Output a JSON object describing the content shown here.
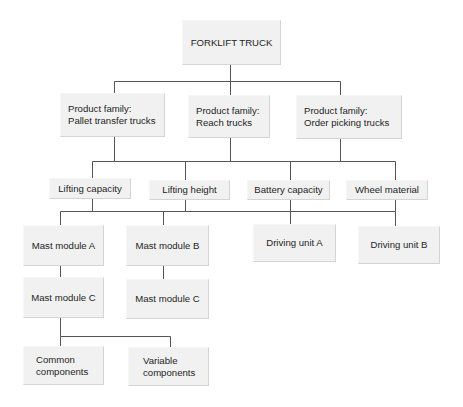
{
  "diagram": {
    "type": "hierarchy",
    "root": "FORKLIFT TRUCK",
    "product_families": [
      "Product family:\nPallet transfer trucks",
      "Product family:\nReach trucks",
      "Product family:\nOrder picking trucks"
    ],
    "attributes": [
      "Lifting capacity",
      "Lifting height",
      "Battery capacity",
      "Wheel material"
    ],
    "modules": [
      "Mast module A",
      "Mast module B",
      "Driving unit A",
      "Driving unit B"
    ],
    "submodules": [
      "Mast module C",
      "Mast module C"
    ],
    "components": [
      "Common\ncomponents",
      "Variable\ncomponents"
    ]
  },
  "colors": {
    "box_fill": "#f1f1f1",
    "line": "#555555",
    "text": "#1e1e1e"
  }
}
